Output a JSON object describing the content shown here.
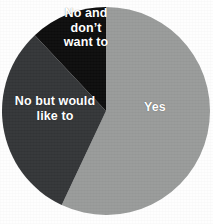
{
  "chart_data": {
    "type": "pie",
    "title": "",
    "subtitle": "",
    "xlabel": "",
    "ylabel": "",
    "legend_position": "none",
    "grid": false,
    "labels_inside_slices": true,
    "categories": [
      "Yes",
      "No but would like to",
      "No and don’t want to"
    ],
    "values": [
      57,
      31,
      12
    ],
    "slices": [
      {
        "label": "Yes",
        "value": 57,
        "color": "#999b9a",
        "text_color": "#ffffff",
        "start_angle_deg": 0,
        "end_angle_deg": 205
      },
      {
        "label": "No but would like to",
        "value": 31,
        "color": "#343638",
        "text_color": "#ffffff",
        "start_angle_deg": 205,
        "end_angle_deg": 318
      },
      {
        "label": "No and don’t want to",
        "value": 12,
        "color": "#0d0d0d",
        "text_color": "#ffffff",
        "start_angle_deg": 318,
        "end_angle_deg": 360
      }
    ]
  },
  "chart": {
    "background_color": "#ffffff",
    "center_x": 106,
    "center_y": 111,
    "radius": 104,
    "slice_labels": {
      "yes": "Yes",
      "no_but_would_like_to": "No but would\nlike to",
      "no_and_dont_want_to": "No and\ndon’t\nwant to"
    }
  }
}
